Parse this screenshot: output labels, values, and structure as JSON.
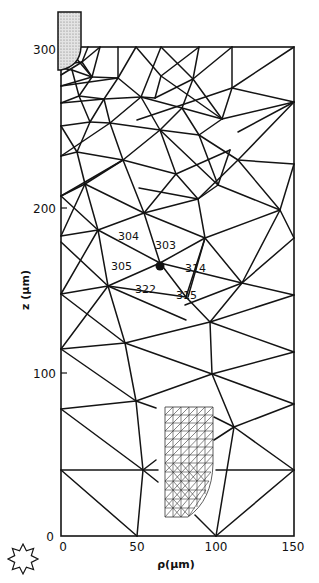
{
  "figure": {
    "type": "finite-element triangular mesh",
    "x_axis": {
      "label": "ρ(μm)",
      "ticks": [
        "0",
        "50",
        "100",
        "150"
      ],
      "range": [
        0,
        150
      ]
    },
    "y_axis": {
      "label": "z (μm)",
      "ticks": [
        "0",
        "100",
        "200",
        "300"
      ],
      "range": [
        0,
        300
      ]
    },
    "origin_label": "0",
    "highlighted_node": {
      "rho": 65,
      "z": 163,
      "neighbor_element_labels": [
        "304",
        "303",
        "305",
        "314",
        "322",
        "315"
      ]
    },
    "electrode": {
      "description": "shaded electrode tip at top-left",
      "rho_range": [
        0,
        14
      ],
      "z_range": [
        300,
        322
      ]
    },
    "refined_submesh": {
      "description": "fine triangulated inset mesh",
      "rho_range": [
        66,
        99
      ],
      "z_range": [
        7,
        79
      ]
    },
    "symbol": "sun-star-icon"
  },
  "colors": {
    "lines": "#141414",
    "electrode_fill": "#d0d0d0",
    "background": "#ffffff"
  }
}
